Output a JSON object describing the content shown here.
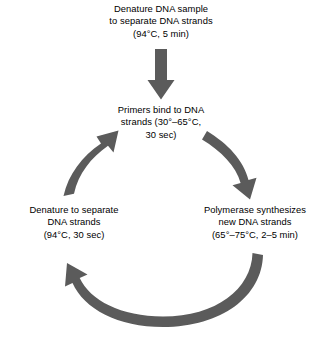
{
  "diagram": {
    "type": "cycle-flow-diagram",
    "colors": {
      "arrow": "#5b5b5b",
      "text": "#000000",
      "background": "#ffffff"
    },
    "steps": [
      {
        "id": "denature-initial",
        "label": "Denature DNA sample\nto separate DNA strands\n(94°C, 5 min)",
        "position": "top"
      },
      {
        "id": "primers-bind",
        "label": "Primers bind to DNA\nstrands (30°–65°C,\n30 sec)",
        "position": "upper-center"
      },
      {
        "id": "polymerase",
        "label": "Polymerase synthesizes\nnew DNA strands\n(65°–75°C, 2–5 min)",
        "position": "right"
      },
      {
        "id": "denature-cycle",
        "label": "Denature to separate\nDNA strands\n(94°C, 30 sec)",
        "position": "left"
      }
    ],
    "arrows": [
      {
        "id": "arrow-entry",
        "shape": "straight-down",
        "from": "denature-initial",
        "to": "primers-bind"
      },
      {
        "id": "arrow-right",
        "shape": "curved-clockwise",
        "from": "primers-bind",
        "to": "polymerase"
      },
      {
        "id": "arrow-bottom",
        "shape": "curved-clockwise",
        "from": "polymerase",
        "to": "denature-cycle"
      },
      {
        "id": "arrow-left",
        "shape": "curved-clockwise",
        "from": "denature-cycle",
        "to": "primers-bind"
      }
    ]
  }
}
